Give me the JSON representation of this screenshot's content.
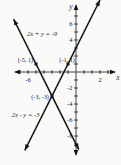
{
  "figure": {
    "background": "#fafaf8",
    "ink": "#141414"
  },
  "chart_data": {
    "type": "line",
    "title": "",
    "xlabel": "x",
    "ylabel": "y",
    "xlim": [
      -7.9,
      4.4
    ],
    "ylim": [
      -10.4,
      8.5
    ],
    "grid": false,
    "x_tick_values": [
      -7,
      -6,
      -5,
      -4,
      -3,
      -2,
      -1,
      1,
      2,
      3,
      4
    ],
    "y_tick_values": [
      -9,
      -8,
      -7,
      -6,
      -5,
      -4,
      -3,
      -2,
      -1,
      1,
      2,
      3,
      4,
      5,
      6,
      7
    ],
    "x_tick_labels": [
      {
        "value": -6,
        "label": "-6",
        "dx": 0
      },
      {
        "value": 2,
        "label": "2",
        "dx": 8
      }
    ],
    "y_tick_labels": [
      {
        "value": 6,
        "label": "6"
      },
      {
        "value": 4,
        "label": "4"
      },
      {
        "value": -2,
        "label": "-2"
      },
      {
        "value": -4,
        "label": "-4"
      },
      {
        "value": -6,
        "label": "-6"
      },
      {
        "value": -8,
        "label": "-8"
      }
    ],
    "series": [
      {
        "name": "line-2x-plus-y-eq-neg9",
        "label": "2x + y = -9",
        "slope": -2,
        "intercept": -9,
        "x_range": [
          -7.8,
          0.35
        ],
        "label_at": [
          -4.25,
          4.55
        ],
        "label_anchor": "middle"
      },
      {
        "name": "line-2x-minus-y-eq-neg3",
        "label": "2x - y = -3",
        "slope": 2,
        "intercept": 3,
        "x_range": [
          -6.4,
          3.0
        ],
        "label_at": [
          -6.3,
          -5.6
        ],
        "label_anchor": "middle"
      }
    ],
    "points": [
      {
        "x": -5,
        "y": 1,
        "label": "(-5, 1)",
        "label_at": [
          -5.35,
          1.25
        ],
        "label_anchor": "end"
      },
      {
        "x": -1,
        "y": 1,
        "label": "(-1, 1)",
        "label_at": [
          -0.15,
          1.25
        ],
        "label_anchor": "end"
      },
      {
        "x": -3,
        "y": -3,
        "label": "(-3, -3)",
        "label_at": [
          -3.4,
          -3.4
        ],
        "label_anchor": "end"
      }
    ],
    "solution": "(-3, -3)"
  }
}
